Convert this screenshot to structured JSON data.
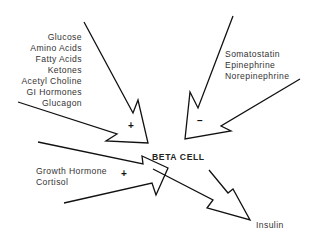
{
  "diagram": {
    "center_label": "BETA CELL",
    "stimulators": {
      "sign": "+",
      "items": [
        "Glucose",
        "Amino Acids",
        "Fatty Acids",
        "Ketones",
        "Acetyl Choline",
        "GI Hormones",
        "Glucagon"
      ]
    },
    "inhibitors": {
      "sign": "–",
      "items": [
        "Somatostatin",
        "Epinephrine",
        "Norepinephrine"
      ]
    },
    "permissive": {
      "sign": "+",
      "items": [
        "Growth Hormone",
        "Cortisol"
      ]
    },
    "output": {
      "label": "Insulin"
    },
    "colors": {
      "stroke": "#111111",
      "text": "#333333",
      "background": "#ffffff"
    }
  }
}
